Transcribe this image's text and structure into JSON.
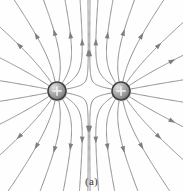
{
  "figure": {
    "caption": "(a)",
    "background_color": "#fefefe",
    "line_color": "#8f8f8f",
    "arrow_color": "#7e7e7e",
    "width": 183,
    "height": 191
  },
  "charges": [
    {
      "id": "left-charge",
      "label": "+",
      "sign": "positive",
      "cx": 57,
      "cy": 91,
      "r": 9,
      "body_color": "#9a9a9a",
      "ring_color": "#3f3f3f",
      "highlight_color": "#d8d8d8"
    },
    {
      "id": "right-charge",
      "label": "+",
      "sign": "positive",
      "cx": 121,
      "cy": 91,
      "r": 9,
      "body_color": "#9a9a9a",
      "ring_color": "#3f3f3f",
      "highlight_color": "#d8d8d8"
    }
  ],
  "chart_data": {
    "type": "line",
    "xlabel": "",
    "ylabel": "",
    "xlim": [
      0,
      183
    ],
    "ylim": [
      0,
      191
    ],
    "grid": false,
    "legend": "none",
    "annotations": [
      "(a)"
    ],
    "field_model": {
      "charges": [
        {
          "x": 57,
          "y": 91,
          "q": 1
        },
        {
          "x": 121,
          "y": 91,
          "q": 1
        }
      ],
      "lines_per_charge": 16,
      "seed_radius": 9,
      "step": 1.1,
      "max_steps": 420,
      "arrow_spacing_steps": 46,
      "arrow_length": 7,
      "arrow_width": 4.6
    }
  }
}
